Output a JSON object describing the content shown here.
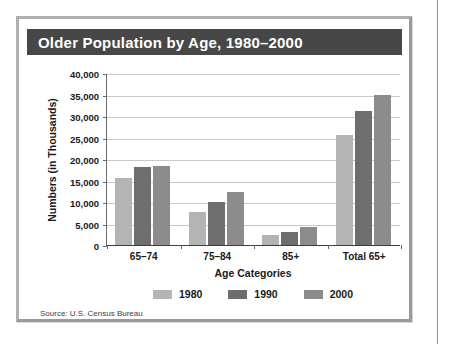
{
  "figure": {
    "title": "Older Population by Age, 1980–2000",
    "source_note": "Source: U.S. Census Bureau"
  },
  "colors": {
    "title_bar": "#474747",
    "title_text": "#ffffff",
    "series_1980": "#b4b4b4",
    "series_1990": "#6e6e6e",
    "series_2000": "#8c8c8c",
    "gridline": "#c9c9c9",
    "axis": "#3d3d3d",
    "frame": "#b0b0b0",
    "page_background": "#ffffff"
  },
  "chart_data": {
    "type": "bar",
    "title": "Older Population by Age, 1980–2000",
    "xlabel": "Age Categories",
    "ylabel": "Numbers (in Thousands)",
    "categories": [
      "65–74",
      "75–84",
      "85+",
      "Total 65+"
    ],
    "series": [
      {
        "name": "1980",
        "color": "#b4b4b4",
        "values": [
          15581,
          7729,
          2240,
          25550
        ]
      },
      {
        "name": "1990",
        "color": "#6e6e6e",
        "values": [
          18107,
          10055,
          3080,
          31242
        ]
      },
      {
        "name": "2000",
        "color": "#8c8c8c",
        "values": [
          18391,
          12361,
          4240,
          34992
        ]
      }
    ],
    "ylim": [
      0,
      40000
    ],
    "ytick_labels": [
      "40,000",
      "35,000",
      "30,000",
      "25,000",
      "20,000",
      "15,000",
      "10,000",
      "5,000",
      "0"
    ],
    "ytick_values": [
      40000,
      35000,
      30000,
      25000,
      20000,
      15000,
      10000,
      5000,
      0
    ],
    "ytick_step": 5000,
    "grid": true,
    "grid_axis": "y",
    "legend_position": "bottom",
    "legend_entries": [
      "1980",
      "1990",
      "2000"
    ]
  }
}
